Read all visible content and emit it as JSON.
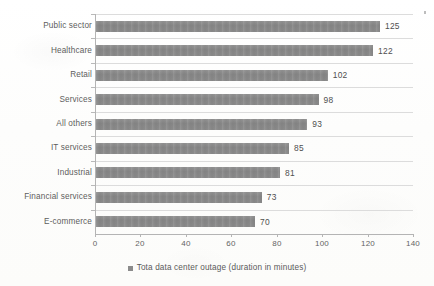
{
  "chart_data": {
    "type": "bar",
    "orientation": "horizontal",
    "title": "",
    "xlabel": "",
    "ylabel": "",
    "categories": [
      "Public sector",
      "Healthcare",
      "Retail",
      "Services",
      "All others",
      "IT services",
      "Industrial",
      "Financial services",
      "E-commerce"
    ],
    "values": [
      125,
      122,
      102,
      98,
      93,
      85,
      81,
      73,
      70
    ],
    "series": [
      {
        "name": "Tota data center outage (duration in minutes)",
        "values": [
          125,
          122,
          102,
          98,
          93,
          85,
          81,
          73,
          70
        ]
      }
    ],
    "xlim": [
      0,
      140
    ],
    "xticks": [
      0,
      20,
      40,
      60,
      80,
      100,
      120,
      140
    ],
    "xtick_labels": [
      "0",
      "20",
      "40",
      "60",
      "80",
      "100",
      "120",
      "140"
    ],
    "grid": "horizontal",
    "data_labels": [
      "125",
      "122",
      "102",
      "98",
      "93",
      "85",
      "81",
      "73",
      "70"
    ],
    "legend": {
      "position": "bottom-center",
      "entries": [
        {
          "label": "Tota data center outage (duration in minutes)",
          "color": "#8b8b8b",
          "marker": "square"
        }
      ]
    },
    "colors": {
      "bar": "#8b8b8b",
      "background": "#fdfdfc",
      "axis": "#b4b4b4",
      "gridline": "#dcdcdc",
      "text": "#5a5a5a"
    }
  }
}
